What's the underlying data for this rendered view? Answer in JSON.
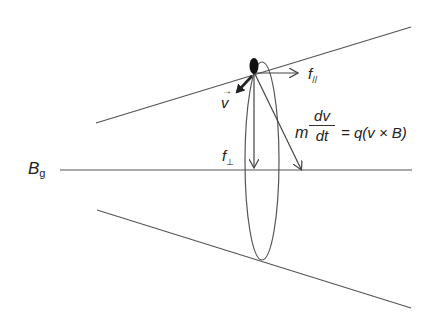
{
  "diagram": {
    "labels": {
      "field": "B",
      "field_sub": "g",
      "velocity": "v",
      "f_parallel": "f",
      "f_parallel_sub": "//",
      "f_perp": "f",
      "f_perp_sub": "⊥",
      "eq_m": "m",
      "eq_num": "dv",
      "eq_den": "dt",
      "eq_rhs": "= q(v × B)"
    },
    "colors": {
      "lines": "#555555",
      "particle": "#111111",
      "text": "#222222"
    }
  }
}
